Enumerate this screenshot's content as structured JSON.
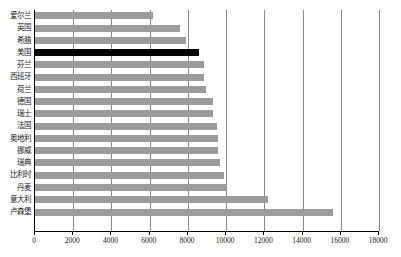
{
  "chart_data": {
    "type": "bar",
    "orientation": "horizontal",
    "title": "",
    "xlabel": "",
    "ylabel": "",
    "xlim": [
      0,
      18000
    ],
    "xticks": [
      0,
      2000,
      4000,
      6000,
      8000,
      10000,
      12000,
      14000,
      16000,
      18000
    ],
    "xtick_labels": [
      "0",
      "2000",
      "4000",
      "6000",
      "8000",
      "10000",
      "12000",
      "14000",
      "16000",
      "18000"
    ],
    "grid": "vertical",
    "legend": "none",
    "categories": [
      "爱尔兰",
      "英国",
      "希腊",
      "美国",
      "芬兰",
      "西班牙",
      "荷兰",
      "德国",
      "瑞士",
      "法国",
      "奥地利",
      "挪威",
      "瑞典",
      "比利时",
      "丹麦",
      "意大利",
      "卢森堡"
    ],
    "values": [
      6200,
      7600,
      7900,
      8600,
      8850,
      8850,
      8950,
      9300,
      9300,
      9500,
      9600,
      9600,
      9700,
      9900,
      10050,
      12200,
      15600
    ],
    "highlighted_category": "美国",
    "colors": {
      "bar": "#9c9c9c",
      "bar_highlight": "#000000",
      "gridline": "#8a8a8a",
      "axis": "#000000",
      "text": "#1a1a1a",
      "background": "#ffffff"
    }
  }
}
